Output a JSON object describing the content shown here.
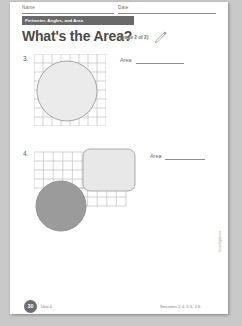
{
  "worksheet": {
    "header": {
      "name_label": "Name",
      "date_label": "Date",
      "unit_banner": "Perimeter, Angles, and Area"
    },
    "title": "What's the Area?",
    "title_note": "(page 2 of 2)",
    "pencil_icon": "pencil-icon",
    "problems": [
      {
        "number": "3.",
        "area_label": "Area",
        "grid": {
          "cols": 8,
          "rows": 8,
          "cell": 8.6
        },
        "shapes": [
          {
            "type": "circle",
            "fill": "#ebebeb",
            "stroke": "#9a9a9a"
          }
        ]
      },
      {
        "number": "4.",
        "area_label": "Area",
        "grid": {
          "cols": 6,
          "rows": 5,
          "cell": 8.6
        },
        "shapes": [
          {
            "type": "rounded-rect",
            "fill": "#e8e8e8",
            "stroke": "#a0a0a0"
          },
          {
            "type": "circle",
            "fill": "#9b9b9b",
            "stroke": "#8a8a8a"
          }
        ]
      }
    ],
    "footer": {
      "page_number": "30",
      "unit_text": "Unit 4",
      "sessions_text": "Sessions 2.4, 2.5, 2.6"
    },
    "side_note": "Investigations"
  },
  "colors": {
    "page_background": "#c9c9c9",
    "sheet": "#ffffff",
    "banner": "#6a6a6a",
    "title_text": "#4a4a4a",
    "grid_line": "#b4b4b4",
    "light_shape": "#ebebeb",
    "dark_shape": "#9b9b9b"
  }
}
